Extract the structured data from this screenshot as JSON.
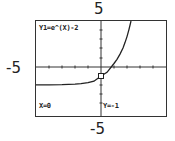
{
  "window_labels": {
    "ymax": "5",
    "xmin": "-5",
    "ymin": "-5"
  },
  "screen": {
    "function_label": "Y1=e^(X)-2",
    "x_readout": "X=0",
    "y_readout": "Y=-1"
  },
  "graph": {
    "function": "e^x - 2",
    "xmin": -5,
    "xmax": 5,
    "ymin": -5,
    "ymax": 5,
    "trace_point": {
      "x": 0,
      "y": -1
    },
    "colors": {
      "curve": "#222222",
      "axes": "#333333",
      "frame": "#333333"
    }
  }
}
